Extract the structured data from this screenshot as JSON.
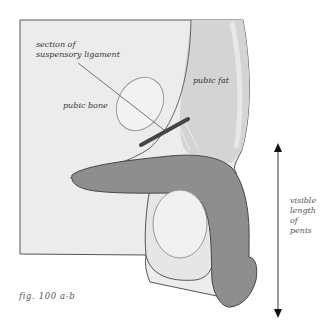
{
  "figure": {
    "caption": "fig. 100 a-b",
    "labels": {
      "ligament_line1": "section of",
      "ligament_line2": "suspensory ligament",
      "pubic_bone": "pubic bone",
      "pubic_fat": "pubic fat",
      "length_line1": "visible",
      "length_line2": "length",
      "length_line3": "of",
      "length_line4": "penis"
    },
    "colors": {
      "background": "#ffffff",
      "frame_fill": "#ececec",
      "outline": "#555555",
      "fat_fill": "#d4d4d4",
      "penis_fill": "#8e8e8e",
      "bone_fill": "#f2f2f2",
      "bone_outline": "#9a9a9a",
      "ligament": "#444444"
    }
  }
}
